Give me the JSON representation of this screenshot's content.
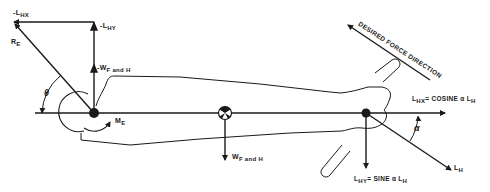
{
  "diagram": {
    "type": "free-body force diagram of forearm and hand",
    "labels": {
      "neg_lhx": {
        "main": "-L",
        "sub": "HX"
      },
      "neg_lhy": {
        "main": "-L",
        "sub": "HY"
      },
      "re": {
        "main": "R",
        "sub": "E"
      },
      "neg_wfh": {
        "main": "-W",
        "sub": "F and H"
      },
      "theta": "θ",
      "me": {
        "main": "M",
        "sub": "E"
      },
      "wfh": {
        "main": "W",
        "sub": "F and H"
      },
      "desired_force": "DESIRED FORCE DIRECTION",
      "lhx_eq": {
        "a": "L",
        "a_sub": "HX",
        "b": "= COSINE α L",
        "b_sub": "H"
      },
      "alpha": "α",
      "lh": {
        "main": "L",
        "sub": "H"
      },
      "lhy_eq": {
        "a": "L",
        "a_sub": "HY",
        "b": "= SINE α  L",
        "b_sub": "H"
      }
    },
    "colors": {
      "ink": "#1a1a1a",
      "background": "#ffffff"
    }
  }
}
